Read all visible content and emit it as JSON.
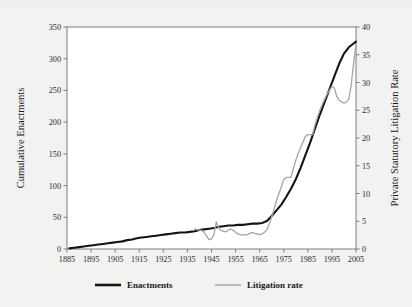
{
  "chart_data": {
    "type": "line",
    "title": "",
    "xlabel": "",
    "ylabel": "Cumulative Enactments",
    "y2label": "Private Statutory Litigation Rate",
    "xlim": [
      1885,
      2005
    ],
    "ylim": [
      0,
      350
    ],
    "y2lim": [
      0,
      40
    ],
    "grid": false,
    "legend_position": "bottom",
    "xticks": [
      1885,
      1895,
      1905,
      1915,
      1925,
      1935,
      1945,
      1955,
      1965,
      1975,
      1985,
      1995,
      2005
    ],
    "yticks": [
      0,
      50,
      100,
      150,
      200,
      250,
      300,
      350
    ],
    "y2ticks": [
      0,
      5,
      10,
      15,
      20,
      25,
      30,
      35,
      40
    ],
    "series": [
      {
        "name": "Enactments",
        "axis": "left",
        "color": "#141414",
        "x": [
          1886,
          1888,
          1890,
          1892,
          1894,
          1896,
          1898,
          1900,
          1902,
          1904,
          1906,
          1908,
          1910,
          1912,
          1914,
          1916,
          1918,
          1920,
          1922,
          1924,
          1926,
          1928,
          1930,
          1932,
          1934,
          1936,
          1938,
          1940,
          1942,
          1944,
          1946,
          1948,
          1950,
          1952,
          1954,
          1956,
          1958,
          1960,
          1962,
          1964,
          1966,
          1968,
          1970,
          1972,
          1974,
          1976,
          1978,
          1980,
          1982,
          1984,
          1986,
          1988,
          1990,
          1992,
          1994,
          1996,
          1998,
          2000,
          2002,
          2004,
          2005
        ],
        "values": [
          1,
          2,
          3,
          4,
          5,
          6,
          7,
          8,
          9,
          10,
          11,
          12,
          14,
          15,
          17,
          18,
          19,
          20,
          21,
          22,
          23,
          24,
          25,
          26,
          26,
          27,
          28,
          30,
          31,
          32,
          33,
          35,
          36,
          37,
          37,
          38,
          38,
          39,
          40,
          40,
          41,
          44,
          52,
          61,
          70,
          82,
          95,
          110,
          128,
          148,
          168,
          190,
          212,
          232,
          252,
          272,
          292,
          308,
          318,
          324,
          327
        ]
      },
      {
        "name": "Litigation rate",
        "axis": "right",
        "color": "#a8a8a8",
        "x": [
          1938,
          1939,
          1940,
          1941,
          1942,
          1943,
          1944,
          1945,
          1946,
          1947,
          1948,
          1949,
          1950,
          1951,
          1952,
          1953,
          1954,
          1955,
          1956,
          1957,
          1958,
          1959,
          1960,
          1961,
          1962,
          1963,
          1964,
          1965,
          1966,
          1967,
          1968,
          1969,
          1970,
          1971,
          1972,
          1973,
          1974,
          1975,
          1976,
          1977,
          1978,
          1979,
          1980,
          1981,
          1982,
          1983,
          1984,
          1985,
          1986,
          1987,
          1988,
          1989,
          1990,
          1991,
          1992,
          1993,
          1994,
          1995,
          1996,
          1997,
          1998,
          1999,
          2000,
          2001,
          2002,
          2003,
          2004,
          2005
        ],
        "values": [
          3.6,
          3.5,
          3.4,
          3.3,
          3.0,
          2.3,
          1.7,
          1.8,
          2.6,
          4.9,
          3.8,
          3.3,
          3.2,
          3.1,
          3.4,
          3.6,
          3.4,
          3.0,
          2.7,
          2.6,
          2.5,
          2.6,
          2.6,
          2.8,
          3.0,
          2.8,
          2.7,
          2.6,
          2.7,
          3.0,
          3.5,
          4.5,
          5.8,
          7.2,
          8.7,
          10.0,
          11.2,
          12.5,
          12.9,
          12.9,
          12.9,
          14.5,
          16.0,
          17.2,
          18.3,
          19.3,
          20.3,
          20.6,
          20.6,
          20.6,
          22.4,
          23.8,
          25.0,
          26.1,
          27.0,
          27.9,
          28.6,
          29.3,
          29.0,
          27.5,
          26.8,
          26.5,
          26.3,
          26.5,
          27.0,
          29.5,
          33.5,
          36.8
        ]
      }
    ]
  },
  "legend": {
    "items": [
      {
        "label": "Enactments",
        "swatch": "thick-black-line"
      },
      {
        "label": "Litigation rate",
        "swatch": "thin-gray-line"
      }
    ]
  },
  "colors": {
    "enactments": "#141414",
    "litigation": "#a8a8a8",
    "axis": "#7d7d7d",
    "background": "#f2f2f0",
    "plot_background": "#ffffff"
  }
}
